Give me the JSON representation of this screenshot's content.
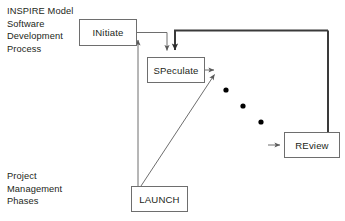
{
  "diagram": {
    "title_caption": "INSPIRE Model\nSoftware\nDevelopment\nProcess",
    "phases_caption": "Project\nManagement\nPhases",
    "nodes": [
      {
        "id": "initiate",
        "label": "INitiate",
        "x": 79,
        "y": 19,
        "w": 58,
        "h": 27
      },
      {
        "id": "speculate",
        "label": "SPeculate",
        "x": 147,
        "y": 57,
        "w": 58,
        "h": 26
      },
      {
        "id": "review",
        "label": "REview",
        "x": 284,
        "y": 132,
        "w": 56,
        "h": 26
      },
      {
        "id": "launch",
        "label": "LAUNCH",
        "x": 131,
        "y": 186,
        "w": 57,
        "h": 26
      }
    ],
    "ellipsis_dots": [
      {
        "cx": 226,
        "cy": 90,
        "r": 2.6
      },
      {
        "cx": 243,
        "cy": 106,
        "r": 2.6
      },
      {
        "cx": 261,
        "cy": 122,
        "r": 2.6
      }
    ],
    "colors": {
      "text": "#231f20",
      "box_border": "#6e6e6e",
      "connector_thin": "#6e6e6e",
      "connector_thick": "#3a3a3a",
      "background": "#ffffff",
      "dot": "#000000"
    },
    "connectors": [
      {
        "name": "initiate-to-speculate",
        "style": "thin"
      },
      {
        "name": "speculate-feedback-loop",
        "style": "thick"
      },
      {
        "name": "launch-to-initiate",
        "style": "thin"
      },
      {
        "name": "launch-to-iteration",
        "style": "thin"
      },
      {
        "name": "speculate-to-iteration",
        "style": "thin"
      },
      {
        "name": "iteration-to-review",
        "style": "thin"
      },
      {
        "name": "review-return-top",
        "style": "thick"
      }
    ]
  }
}
